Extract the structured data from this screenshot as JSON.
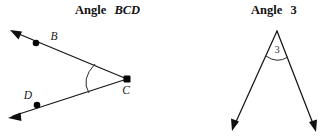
{
  "figure": {
    "width": 329,
    "height": 139,
    "background": "#ffffff",
    "ink_color": "#111111"
  },
  "panels": [
    {
      "id": "angle-bcd",
      "title_prefix": "Angle",
      "title_name": "BCD",
      "title_x": 75,
      "title_y": 14,
      "vertex": {
        "label": "C",
        "x": 127,
        "y": 79,
        "label_x": 122,
        "label_y": 92
      },
      "points": [
        {
          "label": "B",
          "x": 36,
          "y": 43,
          "label_x": 54,
          "label_y": 40
        },
        {
          "label": "D",
          "x": 37,
          "y": 105,
          "label_x": 28,
          "label_y": 99
        }
      ],
      "rays": [
        {
          "name": "ray-cb",
          "from_x": 127,
          "from_y": 79,
          "to_x": 10,
          "to_y": 30
        },
        {
          "name": "ray-cd",
          "from_x": 127,
          "from_y": 79,
          "to_x": 8,
          "to_y": 118
        }
      ],
      "arc": {
        "start_x": 95,
        "start_y": 64,
        "end_x": 89,
        "end_y": 93,
        "ctrl_x": 79,
        "ctrl_y": 79,
        "label": ""
      }
    },
    {
      "id": "angle-3",
      "title_prefix": "Angle",
      "title_name": "3",
      "title_x": 251,
      "title_y": 14,
      "vertex": {
        "label": "",
        "x": 277,
        "y": 31,
        "label_x": 0,
        "label_y": 0
      },
      "points": [],
      "rays": [
        {
          "name": "ray-left",
          "from_x": 277,
          "from_y": 31,
          "to_x": 232,
          "to_y": 131
        },
        {
          "name": "ray-right",
          "from_x": 277,
          "from_y": 31,
          "to_x": 316,
          "to_y": 132
        }
      ],
      "arc": {
        "start_x": 266,
        "start_y": 56,
        "end_x": 288,
        "end_y": 57,
        "ctrl_x": 277,
        "ctrl_y": 66,
        "label": "3",
        "label_x": 277,
        "label_y": 53
      }
    }
  ]
}
